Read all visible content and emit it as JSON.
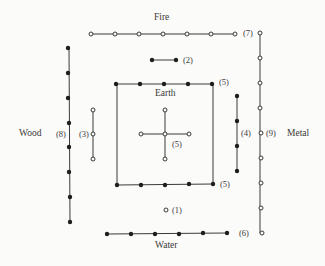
{
  "diagram": {
    "colors": {
      "line": "#3a3a3a",
      "filled_dot": "#1e1e1e",
      "open_dot_fill": "#fbfbf9",
      "background": "#fbfbf9"
    },
    "elements": {
      "fire": "Fire",
      "water": "Water",
      "wood": "Wood",
      "metal": "Metal",
      "earth": "Earth"
    },
    "numbers": {
      "n1": "(1)",
      "n2": "(2)",
      "n3": "(3)",
      "n4": "(4)",
      "n5_top": "(5)",
      "n5_center": "(5)",
      "n5_bottom": "(5)",
      "n6": "(6)",
      "n7": "(7)",
      "n8": "(8)",
      "n9": "(9)"
    },
    "groups": [
      {
        "id": "1",
        "type": "open",
        "count": 1,
        "element": "Water",
        "orientation": "point"
      },
      {
        "id": "2",
        "type": "filled",
        "count": 2,
        "element": "Fire",
        "orientation": "horizontal"
      },
      {
        "id": "3",
        "type": "open",
        "count": 3,
        "element": "Wood",
        "orientation": "vertical"
      },
      {
        "id": "4",
        "type": "filled",
        "count": 4,
        "element": "Metal",
        "orientation": "vertical"
      },
      {
        "id": "5-center",
        "type": "open",
        "count": 5,
        "element": "Earth",
        "orientation": "cross"
      },
      {
        "id": "5-top",
        "type": "filled",
        "count": 5,
        "element": "Earth",
        "orientation": "horizontal"
      },
      {
        "id": "5-bottom",
        "type": "filled",
        "count": 5,
        "element": "Earth",
        "orientation": "horizontal"
      },
      {
        "id": "6",
        "type": "filled",
        "count": 6,
        "element": "Water",
        "orientation": "horizontal"
      },
      {
        "id": "7",
        "type": "open",
        "count": 7,
        "element": "Fire",
        "orientation": "horizontal"
      },
      {
        "id": "8",
        "type": "filled",
        "count": 8,
        "element": "Wood",
        "orientation": "vertical"
      },
      {
        "id": "9",
        "type": "open",
        "count": 9,
        "element": "Metal",
        "orientation": "vertical"
      }
    ]
  }
}
